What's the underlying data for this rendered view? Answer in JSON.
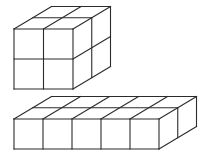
{
  "diagram": {
    "width": 204,
    "height": 158,
    "stroke_color": "#2b2b2b",
    "background": "#ffffff",
    "stroke_width": 1.1,
    "depth_offset": [
      37.5,
      -22.5
    ],
    "shapes": [
      {
        "name": "cube-2x2x2",
        "description": "2 by 2 by 2 arrangement of unit cubes",
        "origin": [
          14,
          29
        ],
        "cols": 2,
        "rows": 2,
        "depth": 2,
        "cell_w": 29.5,
        "cell_h": 30
      },
      {
        "name": "slab-5x1x2",
        "description": "5 by 1 by 2 arrangement of unit cubes",
        "origin": [
          14,
          119
        ],
        "cols": 5,
        "rows": 1,
        "depth": 2,
        "cell_w": 29,
        "cell_h": 30
      }
    ]
  }
}
